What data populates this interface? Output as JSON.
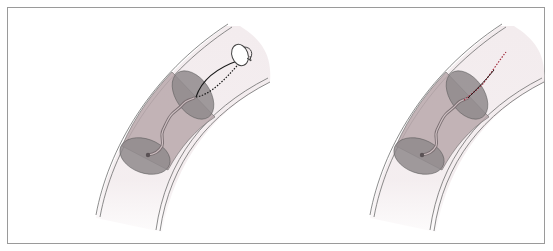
{
  "figure": {
    "panels": [
      {
        "id": "left",
        "description": "Curved vessel segment with a cylindrical sample volume containing a wavy fiber; one end attached to a wire leading to a rotating handle (rotation arrows)",
        "elements": [
          "vessel-wall",
          "cylinder-volume",
          "wavy-fiber",
          "guide-wire-solid",
          "guide-wire-dotted",
          "rotation-handle-icon"
        ]
      },
      {
        "id": "right",
        "description": "Same curved vessel segment and cylindrical volume with wavy fiber; extended red dotted/dark trace continuing beyond the cylinder",
        "elements": [
          "vessel-wall",
          "cylinder-volume",
          "wavy-fiber",
          "red-dotted-trace"
        ]
      }
    ],
    "colors": {
      "frame": "#9a9a9a",
      "vessel_wall": "#6e6e6e",
      "vessel_fill": "#f3ecee",
      "cylinder_fill": "#b8a8ab",
      "ellipse_fill": "#8f8a8c",
      "fiber": "#7a6f72",
      "wire": "#1a1a1a",
      "red_trace": "#a0283a"
    }
  }
}
